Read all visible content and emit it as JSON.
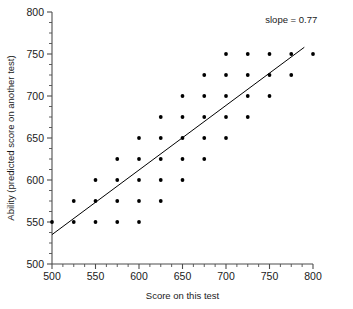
{
  "chart_data": {
    "type": "scatter",
    "title": "",
    "xlabel": "Score on this test",
    "ylabel": "Ability (predicted score on another test)",
    "xlim": [
      500,
      800
    ],
    "ylim": [
      500,
      800
    ],
    "xticks": [
      500,
      550,
      600,
      650,
      700,
      750,
      800
    ],
    "xticklabels": [
      "500",
      "550",
      "600",
      "650",
      "700",
      "750",
      "800"
    ],
    "yticks": [
      500,
      550,
      600,
      650,
      700,
      750,
      800
    ],
    "yticklabels": [
      "500",
      "550",
      "600",
      "650",
      "700",
      "750",
      "800"
    ],
    "xminor_step": 12.5,
    "yminor_step": 12.5,
    "grid": false,
    "legend": false,
    "annotations": [
      {
        "text": "slope = 0.77",
        "x": 775,
        "y": 787
      }
    ],
    "fit_line": {
      "slope": 0.77,
      "x_start": 500,
      "y_start": 535,
      "x_end": 790,
      "y_end": 758
    },
    "points": [
      {
        "x": 500,
        "y": 550
      },
      {
        "x": 525,
        "y": 550
      },
      {
        "x": 525,
        "y": 575
      },
      {
        "x": 550,
        "y": 550
      },
      {
        "x": 550,
        "y": 575
      },
      {
        "x": 550,
        "y": 600
      },
      {
        "x": 575,
        "y": 550
      },
      {
        "x": 575,
        "y": 575
      },
      {
        "x": 575,
        "y": 600
      },
      {
        "x": 575,
        "y": 625
      },
      {
        "x": 600,
        "y": 550
      },
      {
        "x": 600,
        "y": 575
      },
      {
        "x": 600,
        "y": 600
      },
      {
        "x": 600,
        "y": 625
      },
      {
        "x": 600,
        "y": 650
      },
      {
        "x": 625,
        "y": 575
      },
      {
        "x": 625,
        "y": 600
      },
      {
        "x": 625,
        "y": 625
      },
      {
        "x": 625,
        "y": 650
      },
      {
        "x": 625,
        "y": 675
      },
      {
        "x": 650,
        "y": 600
      },
      {
        "x": 650,
        "y": 625
      },
      {
        "x": 650,
        "y": 650
      },
      {
        "x": 650,
        "y": 675
      },
      {
        "x": 650,
        "y": 700
      },
      {
        "x": 675,
        "y": 625
      },
      {
        "x": 675,
        "y": 650
      },
      {
        "x": 675,
        "y": 675
      },
      {
        "x": 675,
        "y": 700
      },
      {
        "x": 675,
        "y": 725
      },
      {
        "x": 700,
        "y": 650
      },
      {
        "x": 700,
        "y": 675
      },
      {
        "x": 700,
        "y": 700
      },
      {
        "x": 700,
        "y": 725
      },
      {
        "x": 700,
        "y": 750
      },
      {
        "x": 725,
        "y": 675
      },
      {
        "x": 725,
        "y": 700
      },
      {
        "x": 725,
        "y": 725
      },
      {
        "x": 725,
        "y": 750
      },
      {
        "x": 750,
        "y": 700
      },
      {
        "x": 750,
        "y": 725
      },
      {
        "x": 750,
        "y": 750
      },
      {
        "x": 775,
        "y": 725
      },
      {
        "x": 775,
        "y": 750
      },
      {
        "x": 800,
        "y": 750
      }
    ]
  }
}
